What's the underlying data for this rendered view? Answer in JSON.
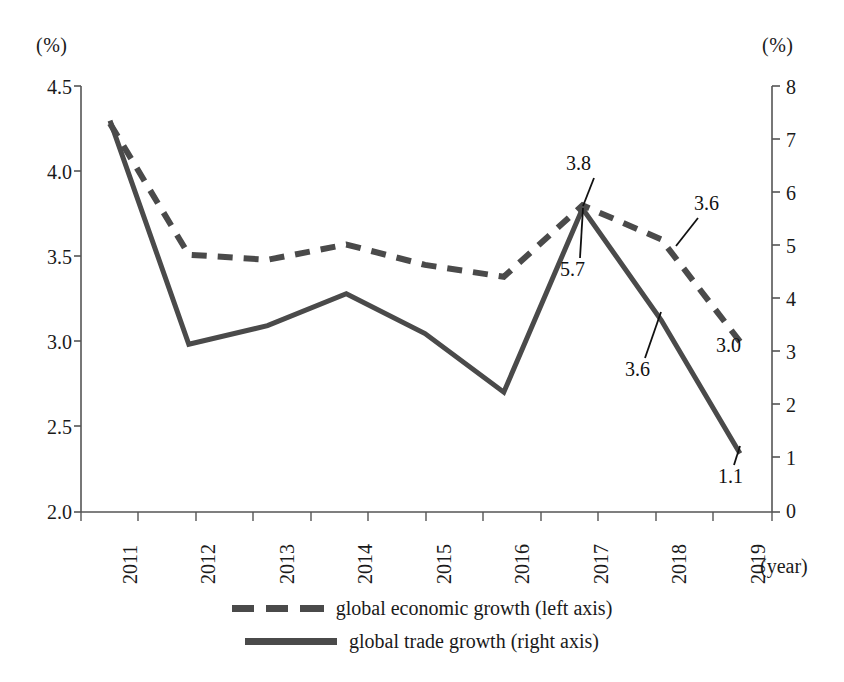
{
  "chart_data": {
    "type": "line",
    "title": "",
    "xlabel": "(year)",
    "categories": [
      "2011",
      "2012",
      "2013",
      "2014",
      "2015",
      "2016",
      "2017",
      "2018",
      "2019"
    ],
    "left_axis": {
      "unit": "(%)",
      "ticks": [
        "4.5",
        "4.0",
        "3.5",
        "3.0",
        "2.5",
        "2.0"
      ],
      "ylim": [
        2.0,
        4.5
      ]
    },
    "right_axis": {
      "unit": "(%)",
      "ticks": [
        "8",
        "7",
        "6",
        "5",
        "4",
        "3",
        "2",
        "1",
        "0"
      ],
      "ylim": [
        0,
        8
      ]
    },
    "grid": false,
    "legend_position": "bottom",
    "series": [
      {
        "name": "global economic growth (left axis)",
        "axis": "left",
        "style": "dashed",
        "color": "#4a4a4a",
        "values": [
          4.28,
          3.51,
          3.48,
          3.57,
          3.45,
          3.38,
          3.8,
          3.6,
          3.0
        ]
      },
      {
        "name": "global trade growth (right axis)",
        "axis": "right",
        "style": "solid",
        "color": "#4a4a4a",
        "values": [
          7.35,
          3.15,
          3.5,
          4.1,
          3.35,
          2.25,
          5.7,
          3.6,
          1.1
        ]
      }
    ],
    "annotations": [
      {
        "text": "3.8",
        "series": "global economic growth (left axis)",
        "category": "2017"
      },
      {
        "text": "3.6",
        "series": "global economic growth (left axis)",
        "category": "2018"
      },
      {
        "text": "3.0",
        "series": "global economic growth (left axis)",
        "category": "2019"
      },
      {
        "text": "5.7",
        "series": "global trade growth (right axis)",
        "category": "2017"
      },
      {
        "text": "3.6",
        "series": "global trade growth (right axis)",
        "category": "2018"
      },
      {
        "text": "1.1",
        "series": "global trade growth (right axis)",
        "category": "2019"
      }
    ]
  },
  "axes": {
    "left_unit": "(%)",
    "right_unit": "(%)",
    "left_ticks": [
      "4.5",
      "4.0",
      "3.5",
      "3.0",
      "2.5",
      "2.0"
    ],
    "right_ticks": [
      "8",
      "7",
      "6",
      "5",
      "4",
      "3",
      "2",
      "1",
      "0"
    ],
    "x_ticks": [
      "2011",
      "2012",
      "2013",
      "2014",
      "2015",
      "2016",
      "2017",
      "2018",
      "2019"
    ],
    "x_caption": "(year)"
  },
  "annotations": {
    "econ_2017": "3.8",
    "econ_2018": "3.6",
    "econ_2019": "3.0",
    "trade_2017": "5.7",
    "trade_2018": "3.6",
    "trade_2019": "1.1"
  },
  "legend": {
    "items": [
      {
        "label": "global economic growth (left axis)",
        "style": "dashed"
      },
      {
        "label": "global trade growth (right axis)",
        "style": "solid"
      }
    ]
  }
}
